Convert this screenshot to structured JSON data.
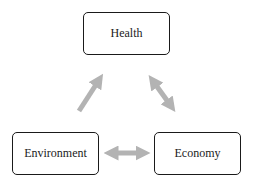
{
  "diagram": {
    "nodes": [
      {
        "id": "health",
        "label": "Health"
      },
      {
        "id": "environment",
        "label": "Environment"
      },
      {
        "id": "economy",
        "label": "Economy"
      }
    ],
    "edges": [
      {
        "from": "environment",
        "to": "health",
        "direction": "one-way"
      },
      {
        "from": "health",
        "to": "economy",
        "direction": "two-way"
      },
      {
        "from": "environment",
        "to": "economy",
        "direction": "two-way"
      }
    ],
    "colors": {
      "arrow": "#b3b3b3",
      "border": "#1a1a1a",
      "text": "#222222"
    }
  }
}
